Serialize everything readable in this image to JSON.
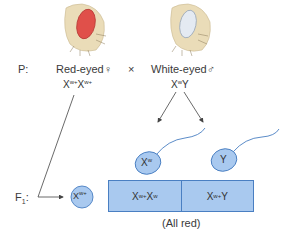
{
  "parents": {
    "generation_label": "P:",
    "female": {
      "label": "Red-eyed",
      "symbol": "♀",
      "genotype": "Xʷ⁺Xʷ⁺",
      "eye_color": "#e0504a"
    },
    "cross_symbol": "×",
    "male": {
      "label": "White-eyed",
      "symbol": "♂",
      "genotype": "XʷY",
      "eye_color": "#e4eaf2"
    }
  },
  "gametes": {
    "egg": "Xʷ⁺",
    "sperm": [
      "Xʷ",
      "Y"
    ]
  },
  "f1": {
    "generation_label": "F₁:",
    "cells": [
      "Xʷ⁺Xʷ",
      "Xʷ⁺Y"
    ],
    "note": "(All red)"
  },
  "colors": {
    "gamete_fill": "#a9c9ef",
    "gamete_stroke": "#4a7fc2",
    "fly_body": "#eadcb8"
  }
}
